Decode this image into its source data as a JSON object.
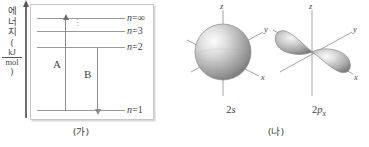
{
  "figure": {
    "panels": [
      {
        "id": "ga",
        "caption": "(가)",
        "y_axis_label": {
          "characters": [
            "에",
            "너",
            "지"
          ],
          "open_paren": "(",
          "numerator": "kJ",
          "denominator": "mol",
          "close_paren": ")",
          "full_text": "에너지(kJ/mol)"
        },
        "levels": [
          {
            "label_n": "n",
            "label_eq": "=",
            "label_value": "∞"
          },
          {
            "label_n": "n",
            "label_eq": "=",
            "label_value": "3"
          },
          {
            "label_n": "n",
            "label_eq": "=",
            "label_value": "2"
          },
          {
            "label_n": "n",
            "label_eq": "=",
            "label_value": "1"
          }
        ],
        "ellipsis": "⋮",
        "transitions": [
          {
            "label": "A",
            "direction": "up"
          },
          {
            "label": "B",
            "direction": "down"
          }
        ]
      },
      {
        "id": "na",
        "caption": "(나)",
        "orbitals": [
          {
            "name": "2s",
            "shell": "2",
            "type": "s",
            "subscript": "",
            "axes": [
              "z",
              "y",
              "x"
            ]
          },
          {
            "name": "2px",
            "shell": "2",
            "type": "p",
            "subscript": "x",
            "axes": [
              "z",
              "y",
              "x"
            ]
          }
        ]
      }
    ]
  },
  "colors": {
    "line": "#9a9a9a",
    "arrow": "#8a8a8a",
    "text": "#3f3f3f",
    "box_border": "#c8c8c8",
    "orbital_light": "#f2f2f2",
    "orbital_mid": "#b5b5b5",
    "orbital_dark": "#6e6e6e"
  }
}
